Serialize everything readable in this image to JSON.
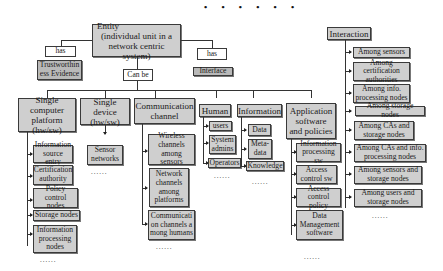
{
  "top_ellipsis": "• • • • • •",
  "root": {
    "line1": "Entity",
    "line2": "(individual unit in a",
    "line3": "network centric system)"
  },
  "relations": {
    "has_left": "has",
    "has_right": "has",
    "can_be": "Can be"
  },
  "attributes": {
    "trustworthiness": "Trustworthiness Evidence",
    "interface": "Interface"
  },
  "categories": [
    {
      "label": "Single computer platform (hw/sw)",
      "children": [
        "Information source entry",
        "Certification authority",
        "Policy control nodes",
        "Storage nodes",
        "Information processing nodes"
      ],
      "ellipsis": "......"
    },
    {
      "label": "Single device (hw/sw)",
      "children": [
        "Sensor networks"
      ],
      "ellipsis": "......"
    },
    {
      "label": "Communication channel",
      "children": [
        "Wireless channels among sensors",
        "Network channels among platforms",
        "Communication channels among humans"
      ],
      "ellipsis": "......"
    },
    {
      "label": "Human",
      "children": [
        "users",
        "System admins",
        "Operators"
      ],
      "ellipsis": "......"
    },
    {
      "label": "Information",
      "children": [
        "Data",
        "Meta-data",
        "Knowledge"
      ],
      "ellipsis": "......"
    },
    {
      "label": "Application software and policies",
      "children": [
        "Information processing sw",
        "Access control sw",
        "Access control policy",
        "Data Management software"
      ],
      "ellipsis": "......"
    }
  ],
  "interaction": {
    "label": "Interaction",
    "children": [
      "Among sensors",
      "Among certification authorities",
      "Among info. processing nodes",
      "Among storage nodes",
      "Among CAs and storage nodes",
      "Among CAs and info. processing nodes",
      "Among sensors and storage nodes",
      "Among users and storage nodes"
    ],
    "ellipsis": "......"
  }
}
